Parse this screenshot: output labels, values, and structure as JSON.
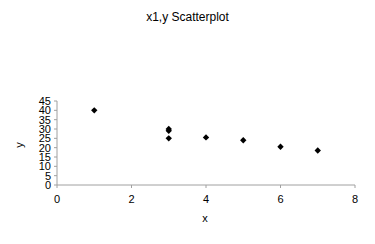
{
  "chart_data": {
    "type": "scatter",
    "title": "x1,y Scatterplot",
    "xlabel": "x",
    "ylabel": "y",
    "xlim": [
      0,
      8
    ],
    "ylim": [
      0,
      45
    ],
    "x_ticks": [
      0,
      2,
      4,
      6,
      8
    ],
    "y_ticks": [
      0,
      5,
      10,
      15,
      20,
      25,
      30,
      35,
      40,
      45
    ],
    "grid": false,
    "legend": null,
    "marker": "diamond",
    "marker_color": "#000000",
    "series": [
      {
        "name": "y",
        "points": [
          {
            "x": 1,
            "y": 40
          },
          {
            "x": 3,
            "y": 30
          },
          {
            "x": 3,
            "y": 29
          },
          {
            "x": 3,
            "y": 25
          },
          {
            "x": 4,
            "y": 25.5
          },
          {
            "x": 5,
            "y": 24
          },
          {
            "x": 6,
            "y": 20.5
          },
          {
            "x": 7,
            "y": 18.5
          }
        ]
      }
    ]
  }
}
